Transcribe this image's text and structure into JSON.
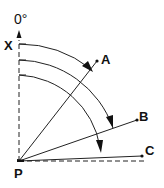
{
  "diagram": {
    "reference_angle_label": "0°",
    "origin_label": "P",
    "reference_label": "X",
    "points": [
      {
        "label": "A"
      },
      {
        "label": "B"
      },
      {
        "label": "C"
      }
    ],
    "colors": {
      "stroke": "#222222",
      "text": "#111111",
      "background": "#ffffff"
    }
  }
}
